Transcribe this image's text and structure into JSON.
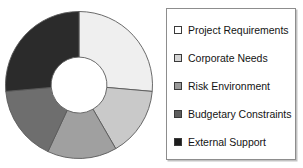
{
  "chart_data": {
    "type": "pie",
    "variant": "donut",
    "title": "",
    "xlabel": "",
    "ylabel": "",
    "legend_position": "right",
    "grid": false,
    "start_angle_deg": 0,
    "direction": "clockwise",
    "inner_radius_ratio": 0.38,
    "categories": [
      "Project Requirements",
      "Corporate Needs",
      "Risk Environment",
      "Budgetary Constraints",
      "External Support"
    ],
    "values": [
      26.4,
      15.3,
      15.3,
      16.7,
      26.4
    ],
    "angles_deg": [
      95,
      55,
      55,
      60,
      95
    ],
    "colors": [
      "#efefef",
      "#c9c9c9",
      "#a0a0a0",
      "#6e6e6e",
      "#2b2b2b"
    ],
    "segments": [
      {
        "label": "Project Requirements",
        "value": 26.4,
        "angle_deg": 95,
        "color": "#efefef"
      },
      {
        "label": "Corporate Needs",
        "value": 15.3,
        "angle_deg": 55,
        "color": "#c9c9c9"
      },
      {
        "label": "Risk Environment",
        "value": 15.3,
        "angle_deg": 55,
        "color": "#a0a0a0"
      },
      {
        "label": "Budgetary Constraints",
        "value": 16.7,
        "angle_deg": 60,
        "color": "#6e6e6e"
      },
      {
        "label": "External Support",
        "value": 26.4,
        "angle_deg": 95,
        "color": "#2b2b2b"
      }
    ]
  },
  "legend": {
    "items": [
      {
        "label": "Project Requirements",
        "swatch": "#ffffff"
      },
      {
        "label": "Corporate Needs",
        "swatch": "#d4d4d4"
      },
      {
        "label": "Risk Environment",
        "swatch": "#9a9a9a"
      },
      {
        "label": "Budgetary Constraints",
        "swatch": "#5e5e5e"
      },
      {
        "label": "External Support",
        "swatch": "#1c1c1c"
      }
    ]
  }
}
